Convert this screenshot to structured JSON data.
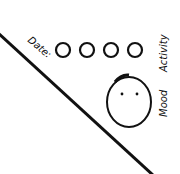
{
  "labels": {
    "date": "Date:",
    "activity": "Activity",
    "mood": "Mood"
  },
  "activity_circles": 4,
  "colors": {
    "ink": "#111111",
    "background": "#ffffff"
  }
}
